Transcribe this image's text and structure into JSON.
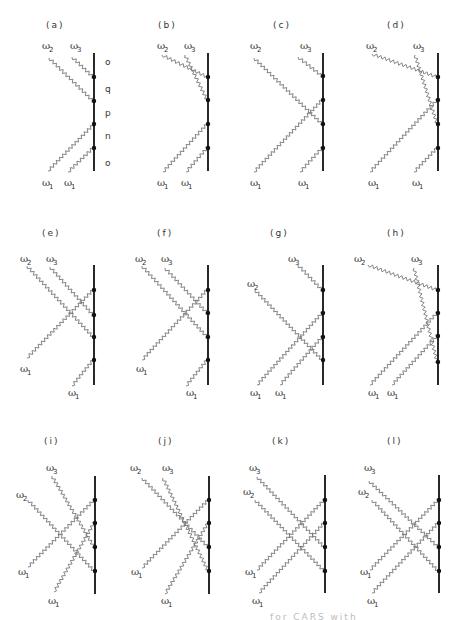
{
  "figure": {
    "title_caption_partial": "for CARS with",
    "colors": {
      "line": "#111111",
      "wave": "#777777",
      "dot": "#111111",
      "text": "#333333"
    },
    "states": [
      "o",
      "q",
      "p",
      "n",
      "o"
    ],
    "panels": [
      {
        "label": "(a)",
        "lx": 46,
        "ly": 28,
        "line_x": 94,
        "y0": 53,
        "y1": 171,
        "dots": [
          77,
          101,
          124,
          148
        ],
        "omegas": [
          {
            "t": "ω",
            "s": "2",
            "x": 42,
            "y": 49
          },
          {
            "t": "ω",
            "s": "3",
            "x": 70,
            "y": 49
          },
          {
            "t": "ω",
            "s": "1",
            "x": 42,
            "y": 186
          },
          {
            "t": "ω",
            "s": "1",
            "x": 64,
            "y": 186
          }
        ],
        "waves": [
          [
            49,
            58,
            93,
            101
          ],
          [
            72,
            57,
            93,
            77
          ],
          [
            48,
            171,
            93,
            125
          ],
          [
            68,
            172,
            93,
            148
          ]
        ],
        "show_states": true
      },
      {
        "label": "(b)",
        "lx": 158,
        "ly": 28,
        "line_x": 208,
        "y0": 53,
        "y1": 171,
        "dots": [
          77,
          100,
          124,
          148
        ],
        "omegas": [
          {
            "t": "ω",
            "s": "2",
            "x": 157,
            "y": 49
          },
          {
            "t": "ω",
            "s": "3",
            "x": 184,
            "y": 49
          },
          {
            "t": "ω",
            "s": "1",
            "x": 157,
            "y": 186
          },
          {
            "t": "ω",
            "s": "1",
            "x": 181,
            "y": 186
          }
        ],
        "waves": [
          [
            162,
            55,
            207,
            77
          ],
          [
            185,
            55,
            207,
            100
          ],
          [
            163,
            172,
            207,
            124
          ],
          [
            186,
            172,
            207,
            148
          ]
        ]
      },
      {
        "label": "(c)",
        "lx": 273,
        "ly": 28,
        "line_x": 323,
        "y0": 53,
        "y1": 171,
        "dots": [
          76,
          100,
          124,
          148
        ],
        "omegas": [
          {
            "t": "ω",
            "s": "2",
            "x": 250,
            "y": 49
          },
          {
            "t": "ω",
            "s": "3",
            "x": 300,
            "y": 49
          },
          {
            "t": "ω",
            "s": "1",
            "x": 250,
            "y": 186
          },
          {
            "t": "ω",
            "s": "1",
            "x": 298,
            "y": 186
          }
        ],
        "waves": [
          [
            254,
            58,
            322,
            124
          ],
          [
            298,
            57,
            322,
            76
          ],
          [
            254,
            172,
            322,
            100
          ],
          [
            300,
            172,
            322,
            148
          ]
        ]
      },
      {
        "label": "(d)",
        "lx": 387,
        "ly": 28,
        "line_x": 438,
        "y0": 53,
        "y1": 171,
        "dots": [
          77,
          100,
          124,
          148
        ],
        "omegas": [
          {
            "t": "ω",
            "s": "2",
            "x": 366,
            "y": 49
          },
          {
            "t": "ω",
            "s": "3",
            "x": 413,
            "y": 49
          },
          {
            "t": "ω",
            "s": "1",
            "x": 368,
            "y": 186
          },
          {
            "t": "ω",
            "s": "1",
            "x": 412,
            "y": 186
          }
        ],
        "waves": [
          [
            372,
            54,
            437,
            77
          ],
          [
            415,
            55,
            437,
            124
          ],
          [
            370,
            172,
            437,
            100
          ],
          [
            414,
            172,
            437,
            148
          ]
        ]
      },
      {
        "label": "(e)",
        "lx": 42,
        "ly": 236,
        "line_x": 94,
        "y0": 265,
        "y1": 385,
        "dots": [
          290,
          315,
          337,
          360
        ],
        "omegas": [
          {
            "t": "ω",
            "s": "2",
            "x": 20,
            "y": 262
          },
          {
            "t": "ω",
            "s": "3",
            "x": 46,
            "y": 262
          },
          {
            "t": "ω",
            "s": "1",
            "x": 20,
            "y": 372
          },
          {
            "t": "ω",
            "s": "1",
            "x": 68,
            "y": 396
          }
        ],
        "waves": [
          [
            27,
            266,
            93,
            337
          ],
          [
            50,
            267,
            93,
            315
          ],
          [
            27,
            358,
            93,
            290
          ],
          [
            72,
            386,
            93,
            360
          ]
        ]
      },
      {
        "label": "(f)",
        "lx": 157,
        "ly": 236,
        "line_x": 208,
        "y0": 265,
        "y1": 385,
        "dots": [
          290,
          313,
          337,
          360
        ],
        "omegas": [
          {
            "t": "ω",
            "s": "2",
            "x": 135,
            "y": 262
          },
          {
            "t": "ω",
            "s": "3",
            "x": 161,
            "y": 262
          },
          {
            "t": "ω",
            "s": "1",
            "x": 136,
            "y": 372
          },
          {
            "t": "ω",
            "s": "1",
            "x": 186,
            "y": 396
          }
        ],
        "waves": [
          [
            142,
            266,
            207,
            337
          ],
          [
            165,
            268,
            207,
            313
          ],
          [
            142,
            360,
            207,
            290
          ],
          [
            186,
            386,
            207,
            360
          ]
        ]
      },
      {
        "label": "(g)",
        "lx": 270,
        "ly": 236,
        "line_x": 323,
        "y0": 265,
        "y1": 385,
        "dots": [
          290,
          313,
          337,
          360
        ],
        "omegas": [
          {
            "t": "ω",
            "s": "3",
            "x": 288,
            "y": 262
          },
          {
            "t": "ω",
            "s": "2",
            "x": 247,
            "y": 287
          },
          {
            "t": "ω",
            "s": "1",
            "x": 250,
            "y": 396
          },
          {
            "t": "ω",
            "s": "1",
            "x": 275,
            "y": 396
          }
        ],
        "waves": [
          [
            298,
            265,
            322,
            290
          ],
          [
            255,
            290,
            322,
            360
          ],
          [
            257,
            385,
            322,
            313
          ],
          [
            280,
            385,
            322,
            337
          ]
        ]
      },
      {
        "label": "(h)",
        "lx": 387,
        "ly": 236,
        "line_x": 438,
        "y0": 265,
        "y1": 385,
        "dots": [
          290,
          313,
          336,
          362
        ],
        "omegas": [
          {
            "t": "ω",
            "s": "2",
            "x": 354,
            "y": 262
          },
          {
            "t": "ω",
            "s": "3",
            "x": 411,
            "y": 262
          },
          {
            "t": "ω",
            "s": "1",
            "x": 368,
            "y": 396
          },
          {
            "t": "ω",
            "s": "1",
            "x": 387,
            "y": 396
          }
        ],
        "waves": [
          [
            368,
            265,
            437,
            290
          ],
          [
            414,
            268,
            437,
            362
          ],
          [
            370,
            385,
            437,
            313
          ],
          [
            392,
            385,
            437,
            336
          ]
        ]
      },
      {
        "label": "(i)",
        "lx": 44,
        "ly": 444,
        "line_x": 95,
        "y0": 476,
        "y1": 594,
        "dots": [
          500,
          523,
          547,
          571
        ],
        "omegas": [
          {
            "t": "ω",
            "s": "3",
            "x": 46,
            "y": 471
          },
          {
            "t": "ω",
            "s": "2",
            "x": 16,
            "y": 498
          },
          {
            "t": "ω",
            "s": "1",
            "x": 18,
            "y": 575
          },
          {
            "t": "ω",
            "s": "1",
            "x": 48,
            "y": 604
          }
        ],
        "waves": [
          [
            52,
            476,
            94,
            547
          ],
          [
            28,
            500,
            94,
            571
          ],
          [
            28,
            567,
            94,
            500
          ],
          [
            54,
            592,
            94,
            523
          ]
        ]
      },
      {
        "label": "(j)",
        "lx": 158,
        "ly": 444,
        "line_x": 209,
        "y0": 476,
        "y1": 594,
        "dots": [
          500,
          523,
          547,
          571
        ],
        "omegas": [
          {
            "t": "ω",
            "s": "2",
            "x": 130,
            "y": 471
          },
          {
            "t": "ω",
            "s": "3",
            "x": 162,
            "y": 471
          },
          {
            "t": "ω",
            "s": "1",
            "x": 131,
            "y": 575
          },
          {
            "t": "ω",
            "s": "1",
            "x": 161,
            "y": 604
          }
        ],
        "waves": [
          [
            142,
            478,
            208,
            547
          ],
          [
            163,
            478,
            208,
            571
          ],
          [
            142,
            568,
            208,
            500
          ],
          [
            165,
            594,
            208,
            523
          ]
        ]
      },
      {
        "label": "(k)",
        "lx": 272,
        "ly": 444,
        "line_x": 325,
        "y0": 475,
        "y1": 593,
        "dots": [
          500,
          523,
          547,
          571
        ],
        "omegas": [
          {
            "t": "ω",
            "s": "3",
            "x": 249,
            "y": 471
          },
          {
            "t": "ω",
            "s": "2",
            "x": 243,
            "y": 495
          },
          {
            "t": "ω",
            "s": "1",
            "x": 245,
            "y": 575
          },
          {
            "t": "ω",
            "s": "1",
            "x": 252,
            "y": 604
          }
        ],
        "waves": [
          [
            257,
            477,
            324,
            547
          ],
          [
            255,
            500,
            324,
            571
          ],
          [
            257,
            570,
            324,
            500
          ],
          [
            259,
            593,
            324,
            523
          ]
        ]
      },
      {
        "label": "(l)",
        "lx": 387,
        "ly": 444,
        "line_x": 439,
        "y0": 475,
        "y1": 593,
        "dots": [
          500,
          523,
          547,
          571
        ],
        "omegas": [
          {
            "t": "ω",
            "s": "3",
            "x": 364,
            "y": 471
          },
          {
            "t": "ω",
            "s": "2",
            "x": 358,
            "y": 495
          },
          {
            "t": "ω",
            "s": "1",
            "x": 360,
            "y": 575
          },
          {
            "t": "ω",
            "s": "1",
            "x": 367,
            "y": 604
          }
        ],
        "waves": [
          [
            369,
            481,
            438,
            547
          ],
          [
            372,
            500,
            438,
            571
          ],
          [
            370,
            570,
            438,
            500
          ],
          [
            372,
            593,
            438,
            523
          ]
        ]
      }
    ]
  }
}
